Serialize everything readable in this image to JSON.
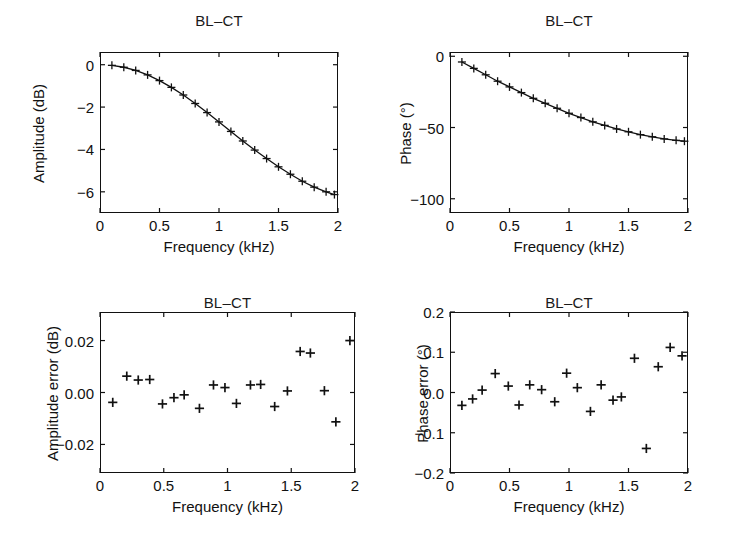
{
  "figure": {
    "background": "#ffffff",
    "ink_color": "#111111",
    "width": 736,
    "height": 543
  },
  "panels": [
    {
      "id": "amplitude",
      "position": "top-left",
      "title": "BL–CT",
      "xlabel": "Frequency (kHz)",
      "ylabel": "Amplitude (dB)",
      "xticks": [
        "0",
        "0.5",
        "1",
        "1.5",
        "2"
      ],
      "yticks": [
        "0",
        "−2",
        "−4",
        "−6"
      ]
    },
    {
      "id": "phase",
      "position": "top-right",
      "title": "BL–CT",
      "xlabel": "Frequency (kHz)",
      "ylabel": "Phase (°)",
      "xticks": [
        "0",
        "0.5",
        "1",
        "1.5",
        "2"
      ],
      "yticks": [
        "0",
        "−50",
        "−100"
      ]
    },
    {
      "id": "amplitude-error",
      "position": "bottom-left",
      "title": "BL–CT",
      "xlabel": "Frequency (kHz)",
      "ylabel": "Amplitude error (dB)",
      "xticks": [
        "0",
        "0.5",
        "1",
        "1.5",
        "2"
      ],
      "yticks": [
        "0.02",
        "0.00",
        "−0.02"
      ]
    },
    {
      "id": "phase-error",
      "position": "bottom-right",
      "title": "BL–CT",
      "xlabel": "Frequency (kHz)",
      "ylabel": "Phase error (°)",
      "xticks": [
        "0",
        "0.5",
        "1",
        "1.5",
        "2"
      ],
      "yticks": [
        "0.2",
        "0.1",
        "0.0",
        "−0.1",
        "−0.2"
      ]
    }
  ],
  "chart_data": [
    {
      "id": "amplitude",
      "type": "line",
      "title": "BL–CT",
      "xlabel": "Frequency (kHz)",
      "ylabel": "Amplitude (dB)",
      "xlim": [
        0,
        2
      ],
      "ylim": [
        -7,
        0.6
      ],
      "xticks": [
        0,
        0.5,
        1,
        1.5,
        2
      ],
      "yticks": [
        0,
        -2,
        -4,
        -6
      ],
      "grid": false,
      "legend": null,
      "marker": "plus",
      "line_style": "solid",
      "x": [
        0.1,
        0.2,
        0.3,
        0.4,
        0.5,
        0.6,
        0.7,
        0.8,
        0.9,
        1.0,
        1.1,
        1.2,
        1.3,
        1.4,
        1.5,
        1.6,
        1.7,
        1.8,
        1.9,
        1.97
      ],
      "y": [
        -0.03,
        -0.12,
        -0.27,
        -0.48,
        -0.75,
        -1.07,
        -1.43,
        -1.83,
        -2.26,
        -2.7,
        -3.15,
        -3.6,
        -4.03,
        -4.43,
        -4.82,
        -5.17,
        -5.5,
        -5.78,
        -6.0,
        -6.13
      ]
    },
    {
      "id": "phase",
      "type": "line",
      "title": "BL–CT",
      "xlabel": "Frequency (kHz)",
      "ylabel": "Phase (°)",
      "xlim": [
        0,
        2
      ],
      "ylim": [
        -110,
        3
      ],
      "xticks": [
        0,
        0.5,
        1,
        1.5,
        2
      ],
      "yticks": [
        0,
        -50,
        -100
      ],
      "grid": false,
      "legend": null,
      "marker": "plus",
      "line_style": "solid",
      "x": [
        0.1,
        0.2,
        0.3,
        0.4,
        0.5,
        0.6,
        0.7,
        0.8,
        0.9,
        1.0,
        1.1,
        1.2,
        1.3,
        1.4,
        1.5,
        1.6,
        1.7,
        1.8,
        1.9,
        1.97
      ],
      "y": [
        -4.0,
        -8.5,
        -13.0,
        -17.5,
        -21.5,
        -25.5,
        -29.5,
        -33.0,
        -36.5,
        -40.0,
        -43.0,
        -46.0,
        -48.5,
        -51.0,
        -53.0,
        -55.0,
        -56.5,
        -58.0,
        -59.0,
        -59.6
      ]
    },
    {
      "id": "amplitude-error",
      "type": "scatter",
      "title": "BL–CT",
      "xlabel": "Frequency (kHz)",
      "ylabel": "Amplitude error (dB)",
      "xlim": [
        0,
        2
      ],
      "ylim": [
        -0.031,
        0.031
      ],
      "xticks": [
        0,
        0.5,
        1,
        1.5,
        2
      ],
      "yticks": [
        0.02,
        0.0,
        -0.02
      ],
      "grid": false,
      "legend": null,
      "marker": "plus",
      "x": [
        0.1,
        0.21,
        0.3,
        0.39,
        0.49,
        0.58,
        0.66,
        0.78,
        0.89,
        0.98,
        1.07,
        1.18,
        1.26,
        1.37,
        1.47,
        1.57,
        1.65,
        1.76,
        1.85,
        1.96
      ],
      "y": [
        -0.0038,
        0.0063,
        0.0048,
        0.005,
        -0.0044,
        -0.002,
        -0.0009,
        -0.0061,
        0.0029,
        0.0019,
        -0.0042,
        0.0029,
        0.0031,
        -0.0054,
        0.0006,
        0.0158,
        0.0152,
        0.0007,
        -0.0113,
        0.02
      ]
    },
    {
      "id": "phase-error",
      "type": "scatter",
      "title": "BL–CT",
      "xlabel": "Frequency (kHz)",
      "ylabel": "Phase error (°)",
      "xlim": [
        0,
        2
      ],
      "ylim": [
        -0.2,
        0.2
      ],
      "xticks": [
        0,
        0.5,
        1,
        1.5,
        2
      ],
      "yticks": [
        0.2,
        0.1,
        0.0,
        -0.1,
        -0.2
      ],
      "grid": false,
      "legend": null,
      "marker": "plus",
      "x": [
        0.1,
        0.19,
        0.27,
        0.38,
        0.49,
        0.58,
        0.67,
        0.77,
        0.88,
        0.98,
        1.07,
        1.18,
        1.27,
        1.37,
        1.44,
        1.55,
        1.65,
        1.75,
        1.85,
        1.95
      ],
      "y": [
        -0.032,
        -0.016,
        0.006,
        0.047,
        0.016,
        -0.031,
        0.019,
        0.007,
        -0.023,
        0.048,
        0.012,
        -0.047,
        0.019,
        -0.019,
        -0.011,
        0.085,
        -0.139,
        0.064,
        0.112,
        0.091
      ]
    }
  ]
}
